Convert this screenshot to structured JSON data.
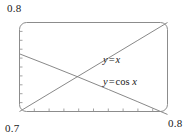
{
  "chart_data": {
    "type": "line",
    "title": "",
    "xlabel": "",
    "ylabel": "",
    "xlim": [
      0.7,
      0.8
    ],
    "ylim": [
      0.7,
      0.8
    ],
    "grid": false,
    "legend_position": "inline-annotation",
    "x_tick_labels": [
      "0.7",
      "0.8"
    ],
    "y_tick_labels": [
      "0.7",
      "0.8"
    ],
    "x_minor_ticks": 10,
    "y_minor_ticks": 10,
    "annotations": [
      {
        "text": "y = x",
        "x": 0.765,
        "y": 0.762
      },
      {
        "text": "y = cos x",
        "x": 0.765,
        "y": 0.738
      }
    ],
    "series": [
      {
        "name": "y = x",
        "label_parts": {
          "lhs": "y",
          "op": "=",
          "rhs": "x"
        },
        "x": [
          0.7,
          0.72,
          0.74,
          0.76,
          0.78,
          0.8
        ],
        "values": [
          0.7,
          0.72,
          0.74,
          0.76,
          0.78,
          0.8
        ]
      },
      {
        "name": "y = cos x",
        "label_parts": {
          "lhs": "y",
          "op": "=",
          "fn": "cos",
          "rhs": "x"
        },
        "x": [
          0.7,
          0.72,
          0.74,
          0.76,
          0.78,
          0.8
        ],
        "values": [
          0.7648,
          0.7518,
          0.7385,
          0.7248,
          0.7109,
          0.6967
        ]
      }
    ],
    "intersection": {
      "x": 0.7391,
      "y": 0.7391
    }
  },
  "labels": {
    "y_max": "0.8",
    "x_min": "0.7",
    "x_max": "0.8"
  },
  "colors": {
    "frame": "#8c8c8c",
    "curve": "#7a7a7a",
    "text": "#1a1a1a",
    "background": "#ffffff"
  }
}
